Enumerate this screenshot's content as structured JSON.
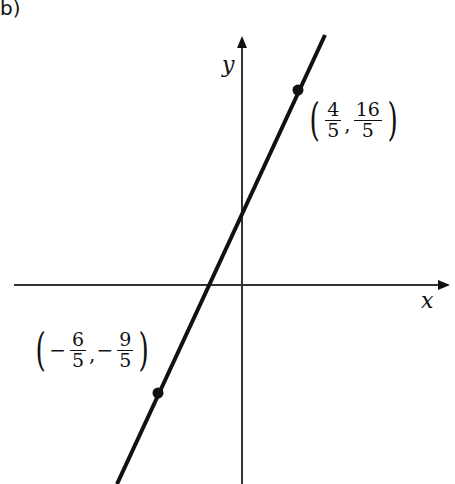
{
  "part_label": "b)",
  "axes": {
    "x_label": "x",
    "y_label": "y"
  },
  "points": [
    {
      "x_num": "4",
      "x_den": "5",
      "x_sign": "",
      "y_num": "16",
      "y_den": "5",
      "y_sign": ""
    },
    {
      "x_num": "6",
      "x_den": "5",
      "x_sign": "−",
      "y_num": "9",
      "y_den": "5",
      "y_sign": "−"
    }
  ],
  "colors": {
    "line": "#111111",
    "axis": "#333333"
  }
}
